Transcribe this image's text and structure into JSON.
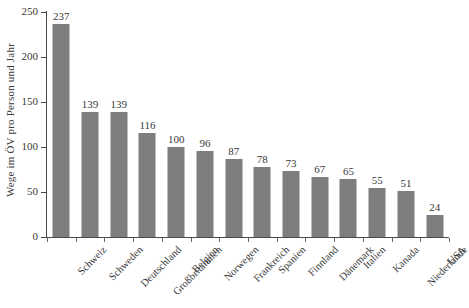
{
  "chart_data": {
    "type": "bar",
    "title": "",
    "subtitle": "",
    "xlabel": "",
    "ylabel": "Wege im ÖV pro Person und Jahr",
    "ylim": [
      0,
      250
    ],
    "yticks": [
      0,
      50,
      100,
      150,
      200,
      250
    ],
    "ytick_labels": [
      "0",
      "50",
      "100",
      "150",
      "200",
      "250"
    ],
    "grid": false,
    "legend": null,
    "bar_color": "#7e7e7e",
    "axis_color": "#4a4a4a",
    "text_color": "#3a3a3a",
    "background": "#ffffff",
    "categories": [
      "Schweiz",
      "Schweden",
      "Deutschland",
      "Großbritannien",
      "Belgien",
      "Norwegen",
      "Frankreich",
      "Spanien",
      "Finnland",
      "Dänemark",
      "Italien",
      "Kanada",
      "Niederlande",
      "USA"
    ],
    "values": [
      237,
      139,
      139,
      116,
      100,
      96,
      87,
      78,
      73,
      67,
      65,
      55,
      51,
      24
    ],
    "value_labels": [
      "237",
      "139",
      "139",
      "116",
      "100",
      "96",
      "87",
      "78",
      "73",
      "67",
      "65",
      "55",
      "51",
      "24"
    ]
  }
}
